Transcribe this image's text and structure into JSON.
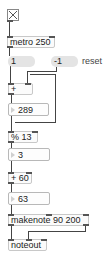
{
  "patch": {
    "toggle": {
      "state": "on",
      "icon": "x-mark"
    },
    "metro": {
      "label": "metro 250"
    },
    "messages": [
      {
        "label": "1"
      },
      {
        "label": "-1"
      }
    ],
    "reset_comment": "reset",
    "plus": {
      "label": "+"
    },
    "counter_number": {
      "value": "289"
    },
    "modulo": {
      "label": "% 13"
    },
    "mod_number": {
      "value": "3"
    },
    "add60": {
      "label": "+ 60"
    },
    "pitch_number": {
      "value": "63"
    },
    "makenote": {
      "label": "makenote 90 200"
    },
    "noteout": {
      "label": "noteout"
    }
  }
}
